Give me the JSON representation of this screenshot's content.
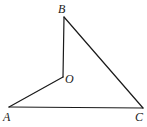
{
  "diagram": {
    "type": "geometry",
    "points": {
      "A": {
        "label": "A",
        "x": 9,
        "y": 107
      },
      "B": {
        "label": "B",
        "x": 64,
        "y": 17
      },
      "C": {
        "label": "C",
        "x": 143,
        "y": 108
      },
      "O": {
        "label": "O",
        "x": 63,
        "y": 77
      }
    },
    "segments": [
      [
        "B",
        "O"
      ],
      [
        "O",
        "A"
      ],
      [
        "A",
        "C"
      ],
      [
        "C",
        "B"
      ]
    ],
    "labels": {
      "A": "A",
      "B": "B",
      "C": "C",
      "O": "O"
    },
    "stroke_color": "#1a1a1a"
  }
}
